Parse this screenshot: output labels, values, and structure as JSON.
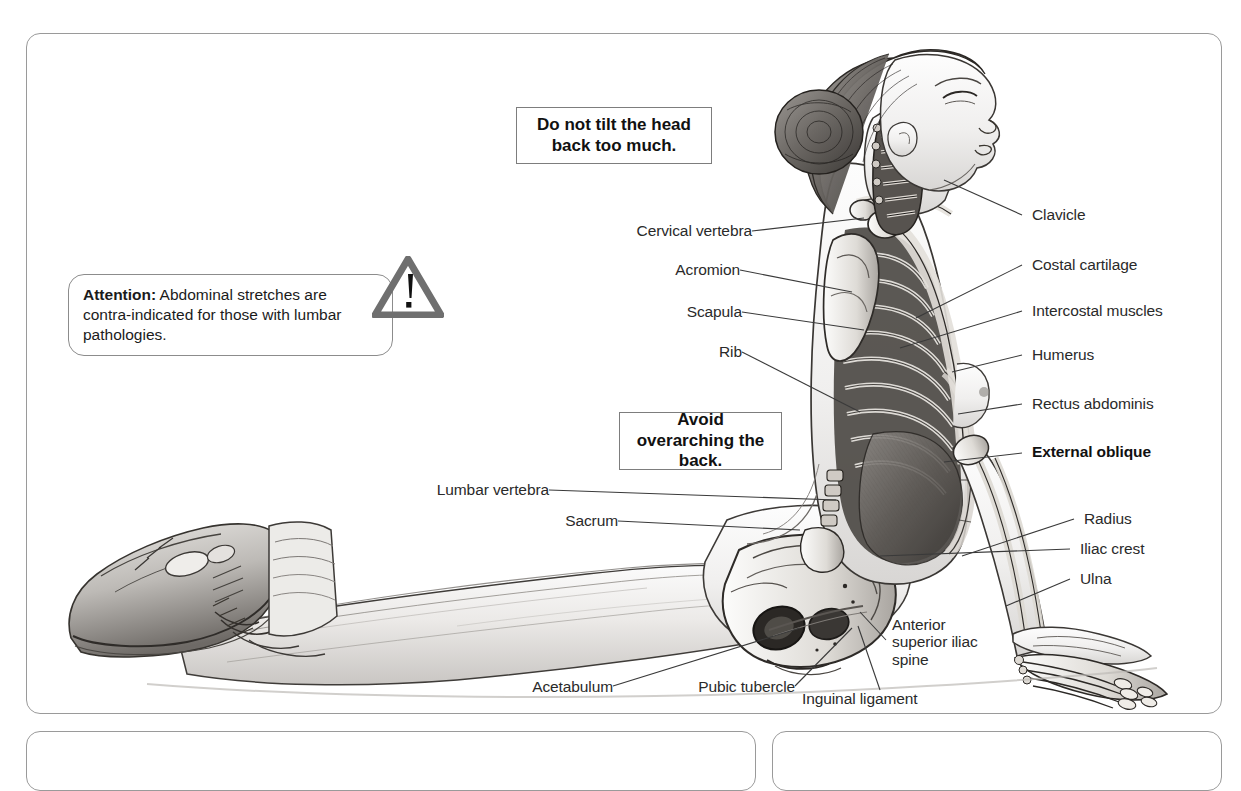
{
  "attention": {
    "lead": "Attention:",
    "body": " Abdominal stretches are contra-indicated for those with lumbar pathologies.",
    "icon": "warning-triangle-icon",
    "icon_glyph": "!"
  },
  "notes": [
    {
      "id": "note-head",
      "text": "Do not tilt the head\nback too much."
    },
    {
      "id": "note-back",
      "text": "Avoid overarching\nthe back."
    }
  ],
  "labels": {
    "cervical_vertebra": "Cervical vertebra",
    "acromion": "Acromion",
    "scapula": "Scapula",
    "rib": "Rib",
    "lumbar_vertebra": "Lumbar vertebra",
    "sacrum": "Sacrum",
    "acetabulum": "Acetabulum",
    "pubic_tubercle": "Pubic tubercle",
    "inguinal_ligament": "Inguinal ligament",
    "anterior_superior_iliac_spine": "Anterior superior iliac spine",
    "clavicle": "Clavicle",
    "costal_cartilage": "Costal cartilage",
    "intercostal_muscles": "Intercostal muscles",
    "humerus": "Humerus",
    "rectus_abdominis": "Rectus abdominis",
    "external_oblique": "External oblique",
    "radius": "Radius",
    "iliac_crest": "Iliac crest",
    "ulna": "Ulna"
  },
  "colors": {
    "panel_border": "#9a9a9a",
    "note_border": "#7d7d7d",
    "leader_line": "#3a3a3a",
    "text": "#2a2a2a",
    "warning_gray": "#6f6f6f"
  }
}
